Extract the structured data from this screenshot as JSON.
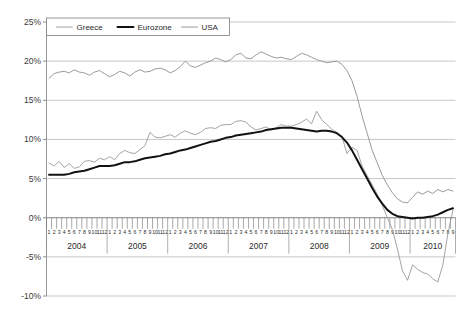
{
  "chart_data": {
    "type": "line",
    "title": "",
    "xlabel": "",
    "ylabel": "",
    "ylim": [
      -10,
      25
    ],
    "grid": true,
    "legend_position": "top-left-inside",
    "y_ticks": [
      "25%",
      "20%",
      "15%",
      "10%",
      "5%",
      "0%",
      "-5%",
      "-10%"
    ],
    "y_tick_values": [
      25,
      20,
      15,
      10,
      5,
      0,
      -5,
      -10
    ],
    "month_labels": [
      "1",
      "2",
      "3",
      "4",
      "5",
      "6",
      "7",
      "8",
      "9",
      "10",
      "11",
      "12"
    ],
    "years": [
      "2004",
      "2005",
      "2006",
      "2007",
      "2008",
      "2009",
      "2010"
    ],
    "x_start": "2004-01",
    "x_end": "2010-09",
    "series": [
      {
        "name": "Greece",
        "color": "#9a9a9a",
        "width": 0.9,
        "values": [
          7.0,
          6.6,
          7.2,
          6.4,
          6.9,
          6.3,
          6.5,
          7.2,
          7.3,
          7.1,
          7.6,
          7.4,
          7.8,
          7.4,
          8.2,
          8.6,
          8.3,
          8.2,
          8.7,
          9.2,
          10.9,
          10.3,
          10.2,
          10.4,
          10.6,
          10.3,
          10.8,
          11.1,
          10.8,
          10.6,
          10.9,
          11.4,
          11.5,
          11.4,
          11.8,
          11.9,
          11.9,
          12.3,
          12.4,
          12.2,
          11.6,
          11.2,
          11.4,
          11.6,
          11.2,
          11.5,
          11.9,
          11.7,
          11.7,
          11.9,
          12.2,
          12.6,
          12.0,
          13.6,
          12.5,
          11.9,
          11.3,
          10.9,
          10.4,
          8.2,
          9.0,
          8.6,
          6.6,
          5.4,
          4.2,
          3.0,
          1.6,
          0.0,
          -1.5,
          -4.0,
          -6.8,
          -8.0,
          -6.0,
          -6.6,
          -7.0,
          -7.2,
          -7.8,
          -8.2,
          -6.0,
          -2.0,
          1.0
        ]
      },
      {
        "name": "Eurozone",
        "color": "#121212",
        "width": 2.0,
        "values": [
          5.5,
          5.5,
          5.5,
          5.5,
          5.6,
          5.8,
          5.9,
          6.0,
          6.2,
          6.4,
          6.6,
          6.6,
          6.6,
          6.7,
          6.9,
          7.1,
          7.1,
          7.2,
          7.4,
          7.6,
          7.7,
          7.8,
          7.9,
          8.1,
          8.2,
          8.4,
          8.6,
          8.7,
          8.9,
          9.1,
          9.3,
          9.5,
          9.7,
          9.8,
          10.0,
          10.2,
          10.3,
          10.5,
          10.6,
          10.7,
          10.8,
          10.9,
          11.0,
          11.2,
          11.3,
          11.4,
          11.5,
          11.5,
          11.5,
          11.4,
          11.3,
          11.2,
          11.1,
          11.0,
          11.1,
          11.1,
          11.0,
          10.8,
          10.3,
          9.6,
          8.6,
          7.4,
          6.2,
          5.0,
          3.8,
          2.7,
          1.8,
          1.0,
          0.5,
          0.2,
          0.1,
          0.0,
          -0.1,
          0.0,
          0.0,
          0.1,
          0.2,
          0.4,
          0.7,
          1.0,
          1.2
        ]
      },
      {
        "name": "USA",
        "color": "#8e8e8e",
        "width": 0.9,
        "values": [
          17.8,
          18.4,
          18.6,
          18.7,
          18.5,
          18.9,
          18.6,
          18.5,
          18.2,
          18.6,
          18.8,
          18.4,
          18.0,
          18.3,
          18.7,
          18.5,
          18.1,
          18.6,
          18.9,
          18.6,
          18.7,
          19.0,
          19.1,
          18.9,
          18.5,
          18.8,
          19.3,
          20.0,
          19.4,
          19.2,
          19.5,
          19.8,
          20.0,
          20.4,
          20.2,
          19.9,
          20.2,
          20.8,
          21.0,
          20.4,
          20.3,
          20.8,
          21.2,
          20.9,
          20.6,
          20.4,
          20.5,
          20.3,
          20.2,
          20.6,
          21.0,
          20.8,
          20.5,
          20.2,
          20.0,
          19.8,
          19.9,
          20.0,
          19.6,
          18.8,
          17.5,
          15.5,
          13.0,
          10.8,
          8.6,
          7.0,
          5.4,
          4.2,
          3.2,
          2.4,
          2.0,
          1.9,
          2.6,
          3.3,
          3.0,
          3.4,
          3.1,
          3.6,
          3.3,
          3.6,
          3.4
        ]
      }
    ]
  },
  "legend": {
    "items": [
      {
        "label": "Greece"
      },
      {
        "label": "Eurozone"
      },
      {
        "label": "USA"
      }
    ]
  }
}
